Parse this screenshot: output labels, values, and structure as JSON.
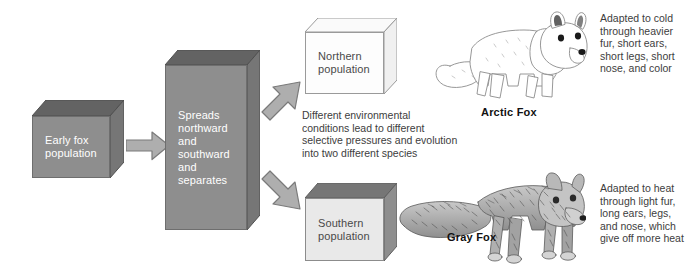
{
  "diagram": {
    "colors": {
      "box_front_dark": "#8e8e8e",
      "box_top_dark": "#636363",
      "box_side_dark": "#767676",
      "box_front_light": "#fdfdfd",
      "box_front_lightgray": "#e9e9e9",
      "arrow_fill": "#aeaeae",
      "arrow_stroke": "#7a7a7a",
      "text_dark": "#3d3d3d",
      "text_white": "#ffffff",
      "background": "#ffffff"
    },
    "boxes": [
      {
        "id": "early-fox-population",
        "label": "Early fox\npopulation",
        "style": "dark"
      },
      {
        "id": "spreads",
        "label": "Spreads\nnorthward\nand\nsouthward\nand\nseparates",
        "style": "dark"
      },
      {
        "id": "northern-population",
        "label": "Northern\npopulation",
        "style": "light"
      },
      {
        "id": "southern-population",
        "label": "Southern\npopulation",
        "style": "lightgray"
      }
    ],
    "arrows": [
      {
        "id": "arrow-right",
        "direction": "right",
        "name": "arrow-early-to-spreads"
      },
      {
        "id": "arrow-up-right",
        "direction": "up-right",
        "name": "arrow-spreads-to-northern"
      },
      {
        "id": "arrow-down-right",
        "direction": "down-right",
        "name": "arrow-spreads-to-southern"
      }
    ],
    "middle_note": "Different environmental\nconditions lead to different\nselective pressures and evolution\ninto two different species",
    "species": [
      {
        "id": "arctic-fox",
        "caption": "Arctic Fox",
        "note": "Adapted to cold\nthrough heavier\nfur, short ears,\nshort legs, short\nnose, and color",
        "illustration": "arctic-fox-illustration"
      },
      {
        "id": "gray-fox",
        "caption": "Gray Fox",
        "note": "Adapted to heat\nthrough light fur,\nlong ears, legs,\nand nose, which\ngive off more heat",
        "illustration": "gray-fox-illustration"
      }
    ]
  }
}
